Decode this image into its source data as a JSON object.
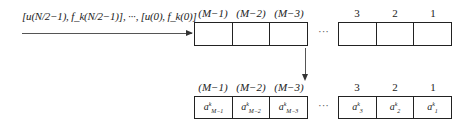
{
  "input": {
    "label": "[u(N/2−1), f_k(N/2−1)], ···, [u(0), f_k(0)]"
  },
  "top_register": {
    "left_indices": [
      "(M−1)",
      "(M−2)",
      "(M−3)"
    ],
    "right_indices": [
      "3",
      "2",
      "1"
    ],
    "ellipsis": "···"
  },
  "bottom_register": {
    "left_indices": [
      "(M−1)",
      "(M−2)",
      "(M−3)"
    ],
    "right_indices": [
      "3",
      "2",
      "1"
    ],
    "ellipsis": "···",
    "left_cells": [
      {
        "base": "a",
        "sup": "k",
        "sub": "M−1"
      },
      {
        "base": "a",
        "sup": "k",
        "sub": "M−2"
      },
      {
        "base": "a",
        "sup": "k",
        "sub": "M−3"
      }
    ],
    "right_cells": [
      {
        "base": "a",
        "sup": "k",
        "sub": "3"
      },
      {
        "base": "a",
        "sup": "k",
        "sub": "2"
      },
      {
        "base": "a",
        "sup": "k",
        "sub": "1"
      }
    ]
  }
}
